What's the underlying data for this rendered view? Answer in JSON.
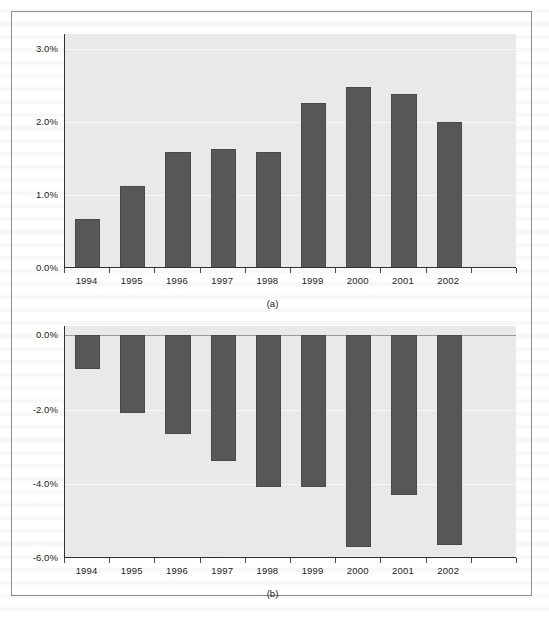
{
  "page": {
    "background_color": "#ffffff",
    "frame_color": "#8d8d8d"
  },
  "style": {
    "bar_color": "#575757",
    "plot_background": "#e9e9e9",
    "gridline_color": "#f6f6f6",
    "axis_color": "#303030",
    "text_color": "#1d1d1d"
  },
  "figure": {
    "panels": [
      {
        "id": "a",
        "caption": "(a)"
      },
      {
        "id": "b",
        "caption": "(b)"
      }
    ]
  },
  "chart_data": [
    {
      "type": "bar",
      "panel": "(a)",
      "title": "",
      "xlabel": "",
      "ylabel": "",
      "categories": [
        "1994",
        "1995",
        "1996",
        "1997",
        "1998",
        "1999",
        "2000",
        "2001",
        "2002"
      ],
      "values": [
        0.67,
        1.12,
        1.58,
        1.63,
        1.58,
        2.26,
        2.48,
        2.38,
        2.0
      ],
      "value_labels": [
        "0.67%",
        "1.12%",
        "1.58%",
        "1.63%",
        "1.58%",
        "2.26%",
        "2.48%",
        "2.38%",
        "2.00%"
      ],
      "ytick_labels": [
        "3.0%",
        "2.0%",
        "1.0%",
        "0.0%"
      ],
      "yticks": [
        3.0,
        2.0,
        1.0,
        0.0
      ],
      "ylim": [
        0.0,
        3.2
      ],
      "grid": true,
      "legend": "none",
      "units": "percent"
    },
    {
      "type": "bar",
      "panel": "(b)",
      "title": "",
      "xlabel": "",
      "ylabel": "",
      "categories": [
        "1994",
        "1995",
        "1996",
        "1997",
        "1998",
        "1999",
        "2000",
        "2001",
        "2002"
      ],
      "values": [
        -0.9,
        -2.1,
        -2.65,
        -3.4,
        -4.1,
        -4.1,
        -5.7,
        -4.3,
        -5.65
      ],
      "value_labels": [
        "-0.90%",
        "-2.10%",
        "-2.65%",
        "-3.40%",
        "-4.10%",
        "-4.10%",
        "-5.70%",
        "-4.30%",
        "-5.65%"
      ],
      "ytick_labels": [
        "0.0%",
        "-2.0%",
        "-4.0%",
        "-6.0%"
      ],
      "yticks": [
        0.0,
        -2.0,
        -4.0,
        -6.0
      ],
      "ylim": [
        -6.0,
        0.25
      ],
      "grid": true,
      "legend": "none",
      "units": "percent"
    }
  ]
}
